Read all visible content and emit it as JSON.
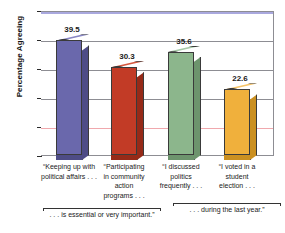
{
  "chart_data": {
    "type": "bar",
    "title": "",
    "xlabel": "",
    "ylabel": "Percentage Agreeing",
    "ylim": [
      0,
      50
    ],
    "yticks": [
      0,
      10,
      20,
      30,
      40,
      50
    ],
    "ytick_labels": [
      "0",
      "10",
      "20",
      "30",
      "40",
      "50"
    ],
    "grid": true,
    "legend": "none",
    "categories": [
      "“Keeping up with political affairs . . .",
      "“Participating in community action programs . . .",
      "“I discussed politics frequently . . .",
      "“I voted in a student election . . ."
    ],
    "category_lines": [
      [
        "“Keeping up with",
        "political affairs . . ."
      ],
      [
        "“Participating",
        "in community",
        "action",
        "programs . . ."
      ],
      [
        "“I discussed",
        "politics",
        "frequently . . ."
      ],
      [
        "“I voted in a",
        "student",
        "election . . ."
      ]
    ],
    "values": [
      39.5,
      30.3,
      35.6,
      22.6
    ],
    "value_labels": [
      "39.5",
      "30.3",
      "35.6",
      "22.6"
    ],
    "colors": [
      "#6a68ac",
      "#c23b26",
      "#8cb68c",
      "#f0b03c"
    ],
    "side_colors": [
      "#4e4c86",
      "#962a18",
      "#6d946d",
      "#cb9021"
    ],
    "top_colors": [
      "#8886c4",
      "#d6583f",
      "#a6c9a6",
      "#f6c468"
    ],
    "annotations": [
      {
        "text": ". . . is essential or very important.”",
        "spans_categories": [
          0,
          1
        ]
      },
      {
        "text": ". . . during the last year.”",
        "spans_categories": [
          2,
          3
        ]
      }
    ]
  },
  "axis": {
    "y_title": "Percentage Agreeing"
  },
  "style": {
    "gridline_color": "#8d8d93",
    "top_gridline_color": "#a9a8de",
    "pink_gridline_color": "#f0a8ad",
    "axis_color": "#2a2a2a",
    "background": "#ffffff"
  }
}
